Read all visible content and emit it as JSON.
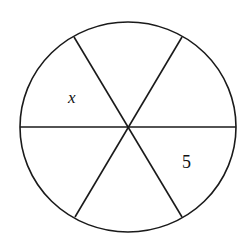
{
  "diagram": {
    "type": "circle divided into six equal sectors by three diameters",
    "stroke_color": "#1a1a1a",
    "background": "#ffffff",
    "circle": {
      "cx": 128,
      "cy": 127,
      "rx": 108,
      "ry": 105
    },
    "sector_count": 6,
    "labels": [
      {
        "id": "x",
        "text": "x",
        "sector": "upper-left",
        "x": 68,
        "y": 103
      },
      {
        "id": "5",
        "text": "5",
        "sector": "lower-right",
        "x": 182,
        "y": 168
      }
    ]
  }
}
